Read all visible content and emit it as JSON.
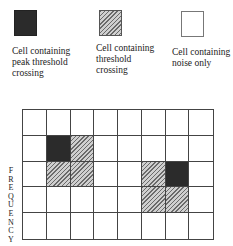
{
  "legend": [
    {
      "type": "peak",
      "label_lines": [
        "Cell containing",
        "peak threshold",
        "crossing"
      ]
    },
    {
      "type": "thresh",
      "label_lines": [
        "Cell containing",
        "threshold",
        "crossing"
      ]
    },
    {
      "type": "noise",
      "label_lines": [
        "Cell containing",
        "noise only"
      ]
    }
  ],
  "grid": {
    "rows": 5,
    "cols": 8,
    "cells": [
      [
        "noise",
        "noise",
        "noise",
        "noise",
        "noise",
        "noise",
        "noise",
        "noise"
      ],
      [
        "noise",
        "peak",
        "thresh",
        "noise",
        "noise",
        "noise",
        "noise",
        "noise"
      ],
      [
        "noise",
        "thresh",
        "thresh",
        "noise",
        "noise",
        "thresh",
        "peak",
        "noise"
      ],
      [
        "noise",
        "noise",
        "noise",
        "noise",
        "noise",
        "thresh",
        "thresh",
        "noise"
      ],
      [
        "noise",
        "noise",
        "noise",
        "noise",
        "noise",
        "noise",
        "noise",
        "noise"
      ]
    ]
  },
  "axis": {
    "y_label": "FREQUENCY"
  },
  "colors": {
    "peak": "#2b2b2b",
    "thresh": "#9a9a9a",
    "noise": "#ffffff",
    "line": "#444444"
  }
}
